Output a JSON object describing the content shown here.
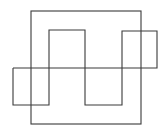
{
  "diagram": {
    "stroke_color": "#3a3a3a",
    "background": "#ffffff",
    "outer_rect": {
      "x": 31,
      "y": 11,
      "width": 110,
      "height": 113
    },
    "square_wave_points": "13,68 13,105 49,105 49,30 85,30 85,105 122,105 122,31 157,31 157,68 13,68"
  }
}
